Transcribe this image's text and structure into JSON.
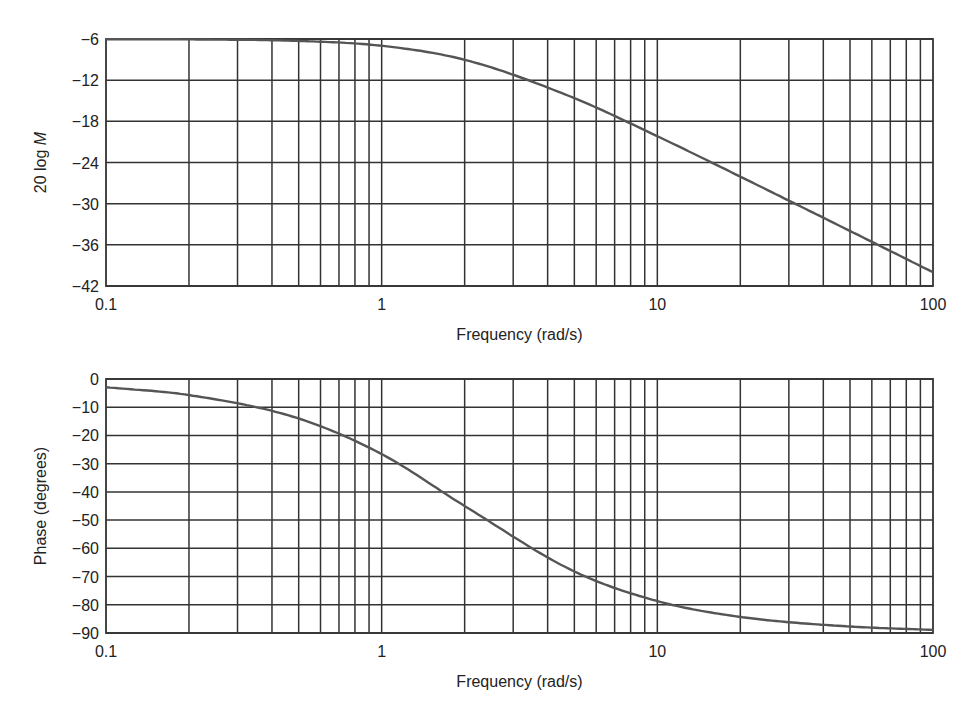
{
  "chart_data": [
    {
      "type": "line",
      "title": "",
      "xlabel": "Frequency (rad/s)",
      "ylabel": "20 log M",
      "xscale": "log",
      "xlim": [
        0.1,
        100
      ],
      "ylim": [
        -42,
        -6
      ],
      "grid": true,
      "xticks": [
        "0.1",
        "1",
        "10",
        "100"
      ],
      "yticks": [
        "-6",
        "-12",
        "-18",
        "-24",
        "-30",
        "-36",
        "-42"
      ],
      "x": [
        0.1,
        0.2,
        0.5,
        1,
        2,
        5,
        10,
        20,
        50,
        100
      ],
      "series": [
        {
          "name": "Magnitude",
          "values": [
            -6.03,
            -6.06,
            -6.28,
            -6.99,
            -9.03,
            -14.62,
            -20.17,
            -26.06,
            -33.98,
            -40.0
          ]
        }
      ],
      "legend": "none"
    },
    {
      "type": "line",
      "title": "",
      "xlabel": "Frequency (rad/s)",
      "ylabel": "Phase (degrees)",
      "xscale": "log",
      "xlim": [
        0.1,
        100
      ],
      "ylim": [
        -90,
        0
      ],
      "grid": true,
      "xticks": [
        "0.1",
        "1",
        "10",
        "100"
      ],
      "yticks": [
        "0",
        "-10",
        "-20",
        "-30",
        "-40",
        "-50",
        "-60",
        "-70",
        "-80",
        "-90"
      ],
      "x": [
        0.1,
        0.2,
        0.5,
        1,
        2,
        5,
        10,
        20,
        50,
        100
      ],
      "series": [
        {
          "name": "Phase",
          "values": [
            -2.9,
            -5.7,
            -14.0,
            -26.6,
            -45.0,
            -68.2,
            -78.7,
            -84.3,
            -87.7,
            -88.9
          ]
        }
      ],
      "legend": "none"
    }
  ],
  "plots": [
    {
      "ylabel_main": "20 log ",
      "ylabel_italic": "M",
      "xlabel": "Frequency (rad/s)",
      "yticks": [
        "−6",
        "−12",
        "−18",
        "−24",
        "−30",
        "−36",
        "−42"
      ],
      "xticks": [
        "0.1",
        "1",
        "10",
        "100"
      ]
    },
    {
      "ylabel_main": "Phase (degrees)",
      "ylabel_italic": "",
      "xlabel": "Frequency (rad/s)",
      "yticks": [
        "0",
        "−10",
        "−20",
        "−30",
        "−40",
        "−50",
        "−60",
        "−70",
        "−80",
        "−90"
      ],
      "xticks": [
        "0.1",
        "1",
        "10",
        "100"
      ]
    }
  ],
  "colors": {
    "grid": "#333333",
    "curve": "#555555",
    "background": "#ffffff"
  }
}
